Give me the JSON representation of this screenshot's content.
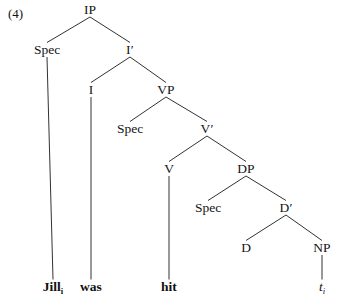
{
  "figure": {
    "example_number": "(4)",
    "caption_sentence": "Jill was hit",
    "background_color": "#ffffff",
    "line_color": "#1b1b1b",
    "text_color": "#141414"
  },
  "tree": {
    "type": "x-bar-syntax-tree",
    "root": "IP",
    "nodes": [
      {
        "id": "IP",
        "label": "IP",
        "x": 90,
        "y": 14,
        "kind": "phrase"
      },
      {
        "id": "SpecIP",
        "label": "Spec",
        "x": 47,
        "y": 54,
        "kind": "specifier"
      },
      {
        "id": "Ibar",
        "label": "I′",
        "x": 130,
        "y": 54,
        "kind": "bar"
      },
      {
        "id": "I",
        "label": "I",
        "x": 91,
        "y": 94,
        "kind": "head"
      },
      {
        "id": "VP",
        "label": "VP",
        "x": 166,
        "y": 94,
        "kind": "phrase"
      },
      {
        "id": "SpecVP",
        "label": "Spec",
        "x": 130,
        "y": 133,
        "kind": "specifier"
      },
      {
        "id": "Vbar",
        "label": "V′",
        "x": 207,
        "y": 133,
        "kind": "bar"
      },
      {
        "id": "V",
        "label": "V",
        "x": 169,
        "y": 173,
        "kind": "head"
      },
      {
        "id": "DP",
        "label": "DP",
        "x": 246,
        "y": 173,
        "kind": "phrase"
      },
      {
        "id": "SpecDP",
        "label": "Spec",
        "x": 208,
        "y": 212,
        "kind": "specifier"
      },
      {
        "id": "Dbar",
        "label": "D′",
        "x": 286,
        "y": 212,
        "kind": "bar"
      },
      {
        "id": "D",
        "label": "D",
        "x": 246,
        "y": 252,
        "kind": "head"
      },
      {
        "id": "NP",
        "label": "NP",
        "x": 322,
        "y": 252,
        "kind": "phrase"
      }
    ],
    "edges": [
      {
        "from": "IP",
        "to": "SpecIP"
      },
      {
        "from": "IP",
        "to": "Ibar"
      },
      {
        "from": "Ibar",
        "to": "I"
      },
      {
        "from": "Ibar",
        "to": "VP"
      },
      {
        "from": "VP",
        "to": "SpecVP"
      },
      {
        "from": "VP",
        "to": "Vbar"
      },
      {
        "from": "Vbar",
        "to": "V"
      },
      {
        "from": "Vbar",
        "to": "DP"
      },
      {
        "from": "DP",
        "to": "SpecDP"
      },
      {
        "from": "DP",
        "to": "Dbar"
      },
      {
        "from": "Dbar",
        "to": "D"
      },
      {
        "from": "Dbar",
        "to": "NP"
      }
    ],
    "terminals": [
      {
        "id": "t-jill",
        "parent": "SpecIP",
        "text": "Jill",
        "subscript": "i",
        "x": 53,
        "y": 291,
        "style": "bold"
      },
      {
        "id": "t-was",
        "parent": "I",
        "text": "was",
        "subscript": "",
        "x": 91,
        "y": 291,
        "style": "bold"
      },
      {
        "id": "t-hit",
        "parent": "V",
        "text": "hit",
        "subscript": "",
        "x": 169,
        "y": 291,
        "style": "bold"
      },
      {
        "id": "t-trace",
        "parent": "NP",
        "text": "t",
        "subscript": "i",
        "x": 322,
        "y": 291,
        "style": "italic"
      }
    ]
  }
}
